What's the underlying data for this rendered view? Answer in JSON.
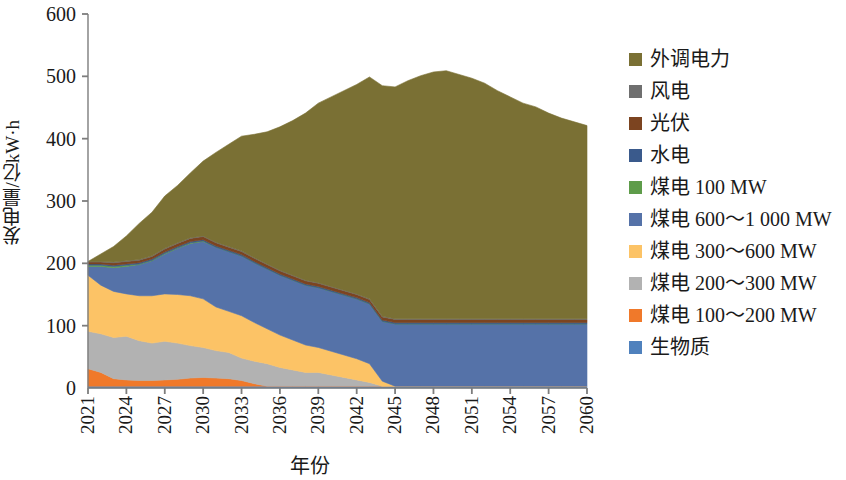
{
  "chart_data": {
    "type": "area",
    "stacked": true,
    "title": "",
    "xlabel": "年份",
    "ylabel": "发电量/亿kW·h",
    "ylim": [
      0,
      600
    ],
    "yticks": [
      0,
      100,
      200,
      300,
      400,
      500,
      600
    ],
    "xlim": [
      2021,
      2060
    ],
    "xticks": [
      2021,
      2024,
      2027,
      2030,
      2033,
      2036,
      2039,
      2042,
      2045,
      2048,
      2051,
      2054,
      2057,
      2060
    ],
    "grid": false,
    "legend_position": "right",
    "x": [
      2021,
      2022,
      2023,
      2024,
      2025,
      2026,
      2027,
      2028,
      2029,
      2030,
      2031,
      2032,
      2033,
      2034,
      2035,
      2036,
      2037,
      2038,
      2039,
      2040,
      2041,
      2042,
      2043,
      2044,
      2045,
      2046,
      2047,
      2048,
      2049,
      2050,
      2051,
      2052,
      2053,
      2054,
      2055,
      2056,
      2057,
      2058,
      2059,
      2060
    ],
    "stack_order_bottom_to_top": [
      "生物质",
      "煤电 100～200 MW",
      "煤电 200～300 MW",
      "煤电 300～600 MW",
      "煤电 600～1 000 MW",
      "煤电 100 MW",
      "水电",
      "光伏",
      "风电",
      "外调电力"
    ],
    "series": [
      {
        "name": "生物质",
        "color": "#4f81bd",
        "values": [
          3,
          3,
          3,
          3,
          3,
          3,
          3,
          3,
          3,
          3,
          3,
          3,
          3,
          3,
          3,
          3,
          3,
          3,
          3,
          3,
          3,
          3,
          3,
          3,
          3,
          3,
          3,
          3,
          3,
          3,
          3,
          3,
          3,
          3,
          3,
          3,
          3,
          3,
          3,
          3
        ]
      },
      {
        "name": "煤电 100～200 MW",
        "color": "#f0792a",
        "values": [
          28,
          22,
          12,
          10,
          9,
          9,
          10,
          11,
          13,
          14,
          13,
          12,
          9,
          4,
          0,
          0,
          0,
          0,
          0,
          0,
          0,
          0,
          0,
          0,
          0,
          0,
          0,
          0,
          0,
          0,
          0,
          0,
          0,
          0,
          0,
          0,
          0,
          0,
          0,
          0
        ]
      },
      {
        "name": "煤电 200～300 MW",
        "color": "#b2b2b2",
        "values": [
          60,
          62,
          66,
          70,
          64,
          60,
          62,
          58,
          52,
          48,
          44,
          42,
          36,
          36,
          36,
          30,
          26,
          22,
          22,
          18,
          14,
          10,
          6,
          0,
          0,
          0,
          0,
          0,
          0,
          0,
          0,
          0,
          0,
          0,
          0,
          0,
          0,
          0,
          0,
          0
        ]
      },
      {
        "name": "煤电 300～600 MW",
        "color": "#fcc366",
        "values": [
          90,
          78,
          74,
          68,
          72,
          76,
          76,
          78,
          80,
          78,
          70,
          66,
          68,
          62,
          56,
          52,
          48,
          44,
          40,
          38,
          36,
          34,
          30,
          8,
          0,
          0,
          0,
          0,
          0,
          0,
          0,
          0,
          0,
          0,
          0,
          0,
          0,
          0,
          0,
          0
        ]
      },
      {
        "name": "煤电 600～1 000 MW",
        "color": "#5572a8",
        "values": [
          14,
          30,
          38,
          44,
          50,
          56,
          64,
          74,
          84,
          92,
          96,
          96,
          96,
          96,
          96,
          96,
          96,
          96,
          96,
          96,
          96,
          96,
          96,
          96,
          100,
          100,
          100,
          100,
          100,
          100,
          100,
          100,
          100,
          100,
          100,
          100,
          100,
          100,
          100,
          100
        ]
      },
      {
        "name": "煤电 100 MW",
        "color": "#5e9c4a",
        "values": [
          2,
          2,
          2,
          2,
          1,
          1,
          1,
          1,
          1,
          1,
          0,
          0,
          0,
          0,
          0,
          0,
          0,
          0,
          0,
          0,
          0,
          0,
          0,
          0,
          0,
          0,
          0,
          0,
          0,
          0,
          0,
          0,
          0,
          0,
          0,
          0,
          0,
          0,
          0,
          0
        ]
      },
      {
        "name": "水电",
        "color": "#3a5a8c",
        "values": [
          2,
          2,
          2,
          2,
          2,
          2,
          2,
          2,
          2,
          2,
          2,
          2,
          2,
          2,
          2,
          2,
          2,
          2,
          2,
          2,
          2,
          2,
          2,
          2,
          2,
          2,
          2,
          2,
          2,
          2,
          2,
          2,
          2,
          2,
          2,
          2,
          2,
          2,
          2,
          2
        ]
      },
      {
        "name": "光伏",
        "color": "#7c4420",
        "values": [
          3,
          3,
          4,
          4,
          4,
          4,
          5,
          5,
          5,
          5,
          5,
          5,
          5,
          5,
          5,
          5,
          5,
          5,
          5,
          5,
          5,
          5,
          5,
          5,
          5,
          5,
          5,
          5,
          5,
          5,
          5,
          5,
          5,
          5,
          5,
          5,
          5,
          5,
          5,
          5
        ]
      },
      {
        "name": "风电",
        "color": "#6f6f6f",
        "values": [
          1,
          1,
          1,
          1,
          1,
          1,
          1,
          1,
          1,
          1,
          1,
          1,
          1,
          1,
          1,
          1,
          1,
          1,
          1,
          1,
          1,
          1,
          1,
          1,
          1,
          1,
          1,
          1,
          1,
          1,
          1,
          1,
          1,
          1,
          1,
          1,
          1,
          1,
          1,
          1
        ]
      },
      {
        "name": "外调电力",
        "color": "#7a7034",
        "values": [
          0,
          12,
          25,
          40,
          58,
          70,
          84,
          92,
          104,
          120,
          144,
          164,
          184,
          198,
          212,
          230,
          248,
          268,
          288,
          304,
          320,
          336,
          356,
          370,
          372,
          382,
          390,
          396,
          398,
          392,
          386,
          378,
          366,
          356,
          346,
          340,
          330,
          322,
          316,
          310
        ]
      }
    ],
    "legend": [
      {
        "label": "外调电力",
        "color": "#7a7034"
      },
      {
        "label": "风电",
        "color": "#6f6f6f"
      },
      {
        "label": "光伏",
        "color": "#7c4420"
      },
      {
        "label": "水电",
        "color": "#3a5a8c"
      },
      {
        "label": "煤电  100 MW",
        "color": "#5e9c4a"
      },
      {
        "label": "煤电  600～1 000 MW",
        "color": "#5572a8"
      },
      {
        "label": "煤电  300～600 MW",
        "color": "#fcc366"
      },
      {
        "label": "煤电  200～300 MW",
        "color": "#b2b2b2"
      },
      {
        "label": "煤电  100～200 MW",
        "color": "#f0792a"
      },
      {
        "label": "生物质",
        "color": "#4f81bd"
      }
    ],
    "axis_color": "#7d7d7d"
  }
}
